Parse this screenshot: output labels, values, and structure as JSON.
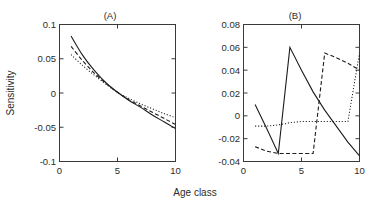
{
  "figure": {
    "xlabel": "Age class",
    "ylabel": "Sensitivity"
  },
  "chart_data": [
    {
      "type": "line",
      "panel": "(A)",
      "title": "(A)",
      "xlabel": "Age class",
      "ylabel": "Sensitivity",
      "xlim": [
        0,
        10
      ],
      "ylim": [
        -0.1,
        0.1
      ],
      "xticks": [
        0,
        5,
        10
      ],
      "xtick_labels": [
        "0",
        "5",
        "10"
      ],
      "yticks": [
        -0.1,
        -0.05,
        0,
        0.05,
        0.1
      ],
      "ytick_labels": [
        "-0.1",
        "-0.05",
        "0",
        "0.05",
        "0.1"
      ],
      "grid": false,
      "legend": "none",
      "x": [
        1,
        2,
        3,
        4,
        5,
        6,
        7,
        8,
        9,
        10
      ],
      "series": [
        {
          "name": "solid",
          "style": "solid",
          "values": [
            0.083,
            0.055,
            0.033,
            0.015,
            0.001,
            -0.011,
            -0.021,
            -0.032,
            -0.042,
            -0.052
          ]
        },
        {
          "name": "dashed",
          "style": "dashed",
          "values": [
            0.068,
            0.047,
            0.029,
            0.014,
            0.001,
            -0.01,
            -0.019,
            -0.028,
            -0.037,
            -0.046
          ]
        },
        {
          "name": "dotted",
          "style": "dotted",
          "values": [
            0.056,
            0.04,
            0.026,
            0.013,
            0.001,
            -0.008,
            -0.016,
            -0.023,
            -0.03,
            -0.036
          ]
        }
      ]
    },
    {
      "type": "line",
      "panel": "(B)",
      "title": "(B)",
      "xlabel": "Age class",
      "ylabel": "Sensitivity",
      "xlim": [
        0,
        10
      ],
      "ylim": [
        -0.04,
        0.08
      ],
      "xticks": [
        0,
        5,
        10
      ],
      "xtick_labels": [
        "0",
        "5",
        "10"
      ],
      "yticks": [
        -0.04,
        -0.02,
        0,
        0.02,
        0.04,
        0.06,
        0.08
      ],
      "ytick_labels": [
        "-0.04",
        "-0.02",
        "0",
        "0.02",
        "0.04",
        "0.06",
        "0.08"
      ],
      "grid": false,
      "legend": "none",
      "x": [
        1,
        2,
        3,
        4,
        5,
        6,
        7,
        8,
        9,
        10
      ],
      "series": [
        {
          "name": "solid",
          "style": "solid",
          "values": [
            0.01,
            -0.011,
            -0.033,
            0.06,
            0.04,
            0.021,
            0.005,
            -0.009,
            -0.023,
            -0.035
          ]
        },
        {
          "name": "dashed",
          "style": "dashed",
          "values": [
            -0.027,
            -0.031,
            -0.033,
            -0.033,
            -0.033,
            -0.033,
            0.055,
            0.051,
            0.046,
            0.04
          ]
        },
        {
          "name": "dotted",
          "style": "dotted",
          "values": [
            -0.009,
            -0.009,
            -0.008,
            -0.006,
            -0.005,
            -0.005,
            -0.005,
            -0.005,
            -0.005,
            0.055
          ]
        }
      ]
    }
  ]
}
